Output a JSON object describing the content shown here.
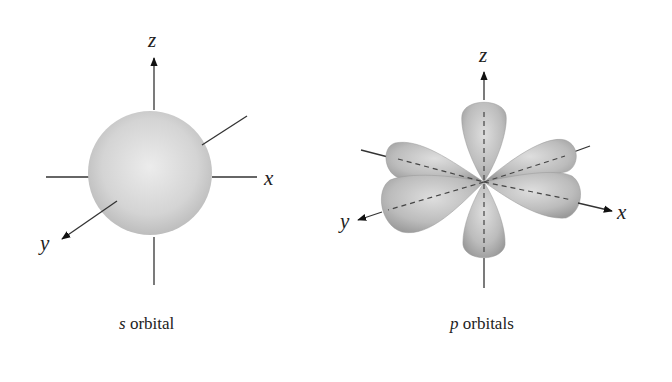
{
  "s_orbital": {
    "caption_letter": "s",
    "caption_rest": " orbital",
    "axes": {
      "x": "x",
      "y": "y",
      "z": "z"
    }
  },
  "p_orbitals": {
    "caption_letter": "p",
    "caption_rest": " orbitals",
    "axes": {
      "x": "x",
      "y": "y",
      "z": "z"
    }
  },
  "colors": {
    "lobe_fill_light": "#e6e6e6",
    "lobe_fill_dark": "#a8a8a8",
    "axis_line": "#333333"
  }
}
